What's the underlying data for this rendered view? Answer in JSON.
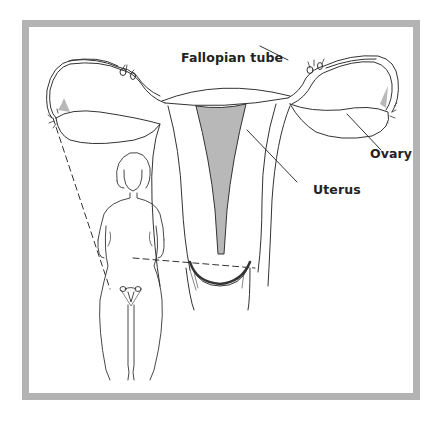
{
  "figure": {
    "labels": {
      "fallopian_tube": "Fallopian tube",
      "ovary": "Ovary",
      "uterus": "Uterus"
    },
    "colors": {
      "frame": "#b3b3b3",
      "fill_shade": "#b8b8b8",
      "line": "#333333"
    }
  }
}
